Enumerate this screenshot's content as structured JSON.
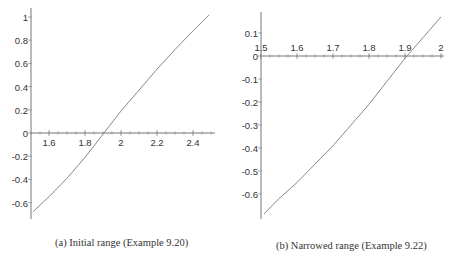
{
  "chart_data": [
    {
      "type": "line",
      "caption": "(a) Initial range (Example 9.20)",
      "title": "",
      "xlabel": "",
      "ylabel": "",
      "xlim": [
        1.5,
        2.5
      ],
      "ylim": [
        -0.7,
        1.02
      ],
      "grid": false,
      "x_ticks": [
        "1.6",
        "1.8",
        "2",
        "2.2",
        "2.4"
      ],
      "y_ticks": [
        "1",
        "0.8",
        "0.6",
        "0.4",
        "0.2",
        "0",
        "-0.2",
        "-0.4",
        "-0.6"
      ],
      "series": [
        {
          "name": "f(x)",
          "x": [
            1.51,
            1.6,
            1.7,
            1.8,
            1.9,
            2.0,
            2.1,
            2.2,
            2.3,
            2.4,
            2.49
          ],
          "y": [
            -0.68,
            -0.55,
            -0.39,
            -0.21,
            -0.01,
            0.19,
            0.37,
            0.55,
            0.72,
            0.88,
            1.02
          ]
        }
      ],
      "root_estimate": 1.906
    },
    {
      "type": "line",
      "caption": "(b) Narrowed range (Example 9.22)",
      "title": "",
      "xlabel": "",
      "ylabel": "",
      "xlim": [
        1.5,
        2.0
      ],
      "ylim": [
        -0.7,
        0.19
      ],
      "grid": false,
      "x_ticks": [
        "1.5",
        "1.6",
        "1.7",
        "1.8",
        "1.9",
        "2"
      ],
      "y_ticks": [
        "0.1",
        "0",
        "-0.1",
        "-0.2",
        "-0.3",
        "-0.4",
        "-0.5",
        "-0.6"
      ],
      "series": [
        {
          "name": "f(x)",
          "x": [
            1.508,
            1.55,
            1.6,
            1.65,
            1.7,
            1.75,
            1.8,
            1.85,
            1.9,
            1.95,
            2.0
          ],
          "y": [
            -0.687,
            -0.62,
            -0.55,
            -0.47,
            -0.39,
            -0.3,
            -0.21,
            -0.11,
            -0.01,
            0.08,
            0.17
          ]
        }
      ],
      "root_estimate": 1.903
    }
  ],
  "captions": {
    "a": "(a) Initial range (Example 9.20)",
    "b": "(b) Narrowed range (Example 9.22)"
  }
}
